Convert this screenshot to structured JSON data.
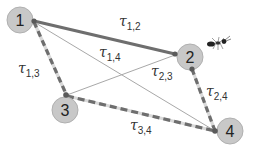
{
  "diagram": {
    "title": "",
    "nodes": [
      {
        "id": "1",
        "label": "1",
        "x": 20,
        "y": 20
      },
      {
        "id": "2",
        "label": "2",
        "x": 190,
        "y": 57
      },
      {
        "id": "3",
        "label": "3",
        "x": 65,
        "y": 110
      },
      {
        "id": "4",
        "label": "4",
        "x": 233,
        "y": 133
      }
    ],
    "edges": [
      {
        "from": "1",
        "to": "2",
        "label": "τ",
        "sub": "1,2",
        "style": "thick-solid"
      },
      {
        "from": "1",
        "to": "3",
        "label": "τ",
        "sub": "1,3",
        "style": "dashed"
      },
      {
        "from": "1",
        "to": "4",
        "label": "τ",
        "sub": "1,4",
        "style": "thin"
      },
      {
        "from": "2",
        "to": "3",
        "label": "τ",
        "sub": "2,3",
        "style": "thin"
      },
      {
        "from": "2",
        "to": "4",
        "label": "τ",
        "sub": "2,4",
        "style": "dashed"
      },
      {
        "from": "3",
        "to": "4",
        "label": "τ",
        "sub": "3,4",
        "style": "dashed"
      }
    ],
    "ant_icon": "ant-icon",
    "colors": {
      "node_fill": "#c8c8c8",
      "node_stroke": "#b0b0b0",
      "edge_dark": "#6e6e6e",
      "edge_light": "#a8a8a8",
      "dash_light": "#d9d9d9",
      "endpoint": "#5a5a5a"
    }
  }
}
